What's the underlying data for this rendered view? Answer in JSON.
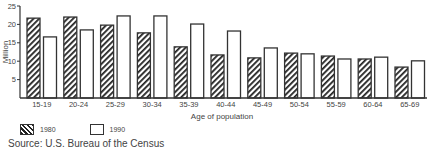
{
  "chart_data": {
    "type": "bar",
    "title": "",
    "xlabel": "Age of population",
    "ylabel": "Million",
    "ylim": [
      0,
      25
    ],
    "yticks": [
      5,
      10,
      15,
      20,
      25
    ],
    "grid": false,
    "legend_position": "bottom-left",
    "categories": [
      "15-19",
      "20-24",
      "25-29",
      "30-34",
      "35-39",
      "40-44",
      "45-49",
      "50-54",
      "55-59",
      "60-64",
      "65-69"
    ],
    "series": [
      {
        "name": "1980",
        "pattern": "hatched",
        "values": [
          21.7,
          22.0,
          19.8,
          17.7,
          13.9,
          11.7,
          10.9,
          12.2,
          11.4,
          10.6,
          8.4
        ]
      },
      {
        "name": "1990",
        "pattern": "plain",
        "values": [
          16.6,
          18.5,
          22.3,
          22.3,
          20.1,
          18.2,
          13.6,
          12.0,
          10.6,
          11.1,
          10.1
        ]
      }
    ],
    "source": "Source: U.S. Bureau of the Census"
  },
  "legend": {
    "items": [
      {
        "label": "1980"
      },
      {
        "label": "1990"
      }
    ]
  },
  "colors": {
    "stroke": "#333333",
    "hatch": "#222222",
    "fill_plain": "#ffffff"
  }
}
